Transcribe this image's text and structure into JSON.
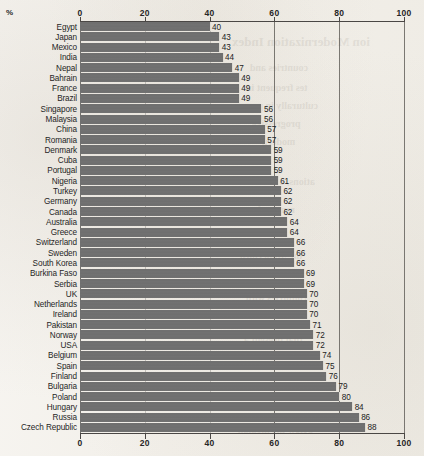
{
  "chart_data": {
    "type": "bar",
    "orientation": "horizontal",
    "title": "",
    "xlabel": "%",
    "ylabel": "",
    "xlim": [
      0,
      100
    ],
    "xticks": [
      0,
      20,
      40,
      60,
      80,
      100
    ],
    "grid": true,
    "legend": null,
    "bar_color": "#6f6f6f",
    "categories": [
      "Egypt",
      "Japan",
      "Mexico",
      "India",
      "Nepal",
      "Bahrain",
      "France",
      "Brazil",
      "Singapore",
      "Malaysia",
      "China",
      "Romania",
      "Denmark",
      "Cuba",
      "Portugal",
      "Nigeria",
      "Turkey",
      "Germany",
      "Canada",
      "Australia",
      "Greece",
      "Switzerland",
      "Sweden",
      "South Korea",
      "Burkina Faso",
      "Serbia",
      "UK",
      "Netherlands",
      "Ireland",
      "Pakistan",
      "Norway",
      "USA",
      "Belgium",
      "Spain",
      "Finland",
      "Bulgaria",
      "Poland",
      "Hungary",
      "Russia",
      "Czech Republic"
    ],
    "values": [
      40,
      43,
      43,
      44,
      47,
      49,
      49,
      49,
      56,
      56,
      57,
      57,
      59,
      59,
      59,
      61,
      62,
      62,
      62,
      64,
      64,
      66,
      66,
      66,
      69,
      69,
      70,
      70,
      70,
      71,
      72,
      72,
      74,
      75,
      76,
      79,
      80,
      84,
      86,
      88
    ]
  },
  "axis": {
    "unit_label": "%",
    "tick_labels_top": [
      "0",
      "20",
      "40",
      "60",
      "80",
      "100"
    ],
    "tick_labels_bottom": [
      "0",
      "20",
      "40",
      "60",
      "80",
      "100"
    ]
  },
  "bleed_through": [
    {
      "text": "ion Modernization Index",
      "left": 232,
      "top": 34,
      "size": 13
    },
    {
      "text": "countries and",
      "left": 250,
      "top": 62,
      "size": 10
    },
    {
      "text": "tes frequent in",
      "left": 246,
      "top": 82,
      "size": 10
    },
    {
      "text": "culturally in paper",
      "left": 238,
      "top": 100,
      "size": 10
    },
    {
      "text": "progressive",
      "left": 252,
      "top": 118,
      "size": 10
    },
    {
      "text": "modern",
      "left": 262,
      "top": 136,
      "size": 10
    },
    {
      "text": "ations, of the same",
      "left": 236,
      "top": 176,
      "size": 10
    },
    {
      "text": "reported",
      "left": 258,
      "top": 204,
      "size": 10
    },
    {
      "text": "the Moderniza",
      "left": 240,
      "top": 250,
      "size": 10
    },
    {
      "text": "countries with",
      "left": 246,
      "top": 292,
      "size": 10
    },
    {
      "text": "that present a",
      "left": 244,
      "top": 334,
      "size": 10
    },
    {
      "text": "below the median",
      "left": 238,
      "top": 424,
      "size": 10
    }
  ]
}
